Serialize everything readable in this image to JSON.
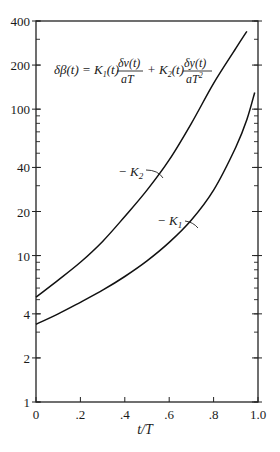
{
  "chart_data": {
    "type": "line",
    "title": "",
    "equation": {
      "lhs": "δβ(t) = K",
      "term1_coef": "(t)",
      "term1_num": "δv(t)",
      "term1_den": "aT",
      "plus": "+ K",
      "term2_coef": "(t)",
      "term2_num": "δy(t)",
      "term2_den": "aT",
      "sub1": "1",
      "sub2": "2",
      "sup2": "2"
    },
    "xlabel": "t/T",
    "ylabel": "",
    "xscale": "linear",
    "yscale": "log",
    "xlim": [
      0,
      1.0
    ],
    "ylim": [
      1,
      400
    ],
    "grid": false,
    "x_ticks": [
      0,
      0.2,
      0.4,
      0.6,
      0.8,
      1.0
    ],
    "x_tick_labels": [
      "0",
      ".2",
      ".4",
      ".6",
      ".8",
      "1.0"
    ],
    "y_ticks": [
      1,
      2,
      4,
      10,
      20,
      40,
      100,
      200,
      400
    ],
    "y_tick_labels": [
      "1",
      "2",
      "4",
      "10",
      "20",
      "40",
      "100",
      "200",
      "400"
    ],
    "series": [
      {
        "name": "−K2",
        "label_main": "− K",
        "label_sub": "2",
        "x": [
          0,
          0.1,
          0.2,
          0.3,
          0.4,
          0.5,
          0.6,
          0.7,
          0.8,
          0.9,
          0.95
        ],
        "values": [
          5.2,
          6.8,
          9.0,
          12.5,
          18.5,
          28,
          45,
          80,
          150,
          260,
          340
        ]
      },
      {
        "name": "−K1",
        "label_main": "− K",
        "label_sub": "1",
        "x": [
          0,
          0.1,
          0.2,
          0.3,
          0.4,
          0.5,
          0.6,
          0.7,
          0.8,
          0.9,
          0.95,
          0.985
        ],
        "values": [
          3.4,
          4.0,
          4.8,
          5.8,
          7.2,
          9.2,
          12.3,
          17.5,
          28,
          55,
          85,
          130
        ]
      }
    ]
  }
}
